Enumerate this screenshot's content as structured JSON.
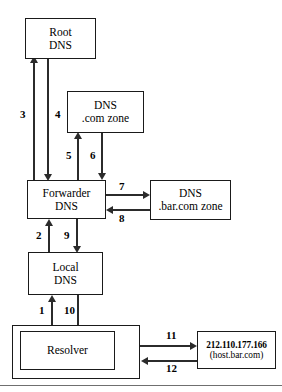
{
  "diagram": {
    "nodes": {
      "root_dns": {
        "line1": "Root",
        "line2": "DNS"
      },
      "com_zone": {
        "line1": "DNS",
        "line2": ".com zone"
      },
      "forwarder": {
        "line1": "Forwarder",
        "line2": "DNS"
      },
      "bar_zone": {
        "line1": "DNS",
        "line2": ".bar.com zone"
      },
      "local_dns": {
        "line1": "Local",
        "line2": "DNS"
      },
      "resolver": {
        "line1": "Resolver",
        "line2": ""
      },
      "host": {
        "line1": "212.110.177.166",
        "line2": "(host.bar.com)"
      }
    },
    "steps": {
      "s1": "1",
      "s2": "2",
      "s3": "3",
      "s4": "4",
      "s5": "5",
      "s6": "6",
      "s7": "7",
      "s8": "8",
      "s9": "9",
      "s10": "10",
      "s11": "11",
      "s12": "12"
    },
    "colors": {
      "stroke": "#1a1a1a",
      "connector": "#2b2b2b",
      "background": "#ffffff",
      "rule": "#6f6f6f"
    }
  }
}
